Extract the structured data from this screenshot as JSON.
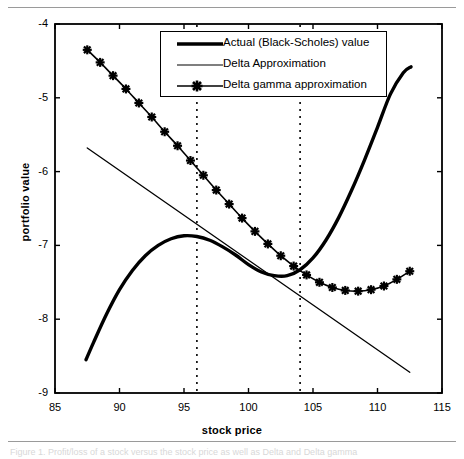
{
  "figure": {
    "x_axis_title": "stock price",
    "y_axis_title": "portfolio value",
    "caption": "Figure 1. Profit/loss of a stock versus the stock price as well as Delta and Delta gamma"
  },
  "legend": {
    "items": [
      {
        "label": "Actual (Black-Scholes) value",
        "style": "thick-line",
        "color": "#000000"
      },
      {
        "label": "Delta Approximation",
        "style": "thin-line",
        "color": "#000000"
      },
      {
        "label": "Delta gamma approximation",
        "style": "line-with-star-marker",
        "color": "#000000"
      }
    ]
  },
  "chart_data": {
    "type": "line",
    "title": "",
    "xlabel": "stock price",
    "ylabel": "portfolio value",
    "xlim": [
      85,
      115
    ],
    "ylim": [
      -9,
      -4
    ],
    "xticks": [
      85,
      90,
      95,
      100,
      105,
      110,
      115
    ],
    "yticks": [
      -9,
      -8,
      -7,
      -6,
      -5,
      -4
    ],
    "grid": false,
    "legend_position": "top-center",
    "annotations": {
      "vertical_dotted_lines": [
        96,
        104
      ]
    },
    "series": [
      {
        "name": "Actual (Black-Scholes) value",
        "style": "thick-solid",
        "color": "#000000",
        "x": [
          87.4,
          88.0,
          89.0,
          90.0,
          91.0,
          92.0,
          93.0,
          94.0,
          95.0,
          96.0,
          97.0,
          98.0,
          99.0,
          100.0,
          101.0,
          102.0,
          103.0,
          104.0,
          105.0,
          106.0,
          107.0,
          108.0,
          109.0,
          110.0,
          111.0,
          112.0,
          112.6
        ],
        "y": [
          -8.55,
          -8.31,
          -7.93,
          -7.6,
          -7.34,
          -7.14,
          -7.0,
          -6.91,
          -6.87,
          -6.88,
          -6.93,
          -7.02,
          -7.13,
          -7.26,
          -7.36,
          -7.41,
          -7.41,
          -7.33,
          -7.17,
          -6.93,
          -6.62,
          -6.25,
          -5.84,
          -5.4,
          -4.95,
          -4.66,
          -4.58
        ]
      },
      {
        "name": "Delta Approximation",
        "style": "thin-solid",
        "color": "#000000",
        "x": [
          87.5,
          112.5
        ],
        "y": [
          -5.68,
          -8.72
        ]
      },
      {
        "name": "Delta gamma approximation",
        "style": "line-with-star-marker",
        "color": "#000000",
        "x": [
          87.5,
          88.5,
          89.5,
          90.5,
          91.5,
          92.5,
          93.5,
          94.5,
          95.5,
          96.5,
          97.5,
          98.5,
          99.5,
          100.5,
          101.5,
          102.5,
          103.5,
          104.5,
          105.5,
          106.5,
          107.5,
          108.5,
          109.5,
          110.5,
          111.5,
          112.5
        ],
        "y": [
          -4.35,
          -4.52,
          -4.7,
          -4.88,
          -5.07,
          -5.26,
          -5.46,
          -5.65,
          -5.85,
          -6.05,
          -6.25,
          -6.44,
          -6.63,
          -6.81,
          -6.98,
          -7.14,
          -7.28,
          -7.4,
          -7.5,
          -7.57,
          -7.61,
          -7.62,
          -7.6,
          -7.55,
          -7.46,
          -7.35
        ]
      }
    ]
  }
}
